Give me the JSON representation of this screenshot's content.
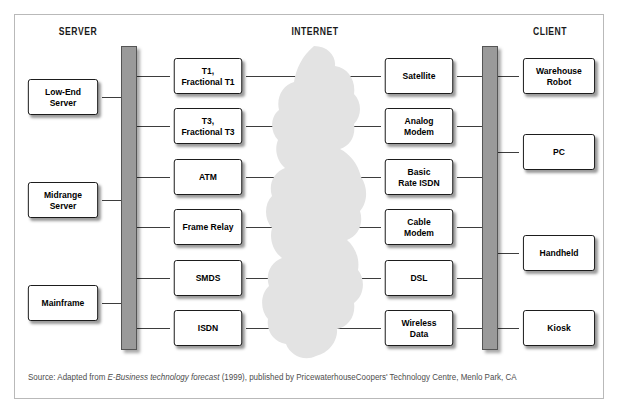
{
  "headers": {
    "server": "SERVER",
    "internet": "INTERNET",
    "client": "CLIENT"
  },
  "colors": {
    "bar_fill": "#9a9a9a",
    "bar_stroke": "#555555",
    "cloud_fill": "#e3e3e3",
    "box_fill": "#ffffff",
    "box_stroke": "#111111",
    "line": "#3d3d3d",
    "frame": "#b9b9b9",
    "caption_text": "#4d4d4d",
    "header_text": "#1a1a1a"
  },
  "columns": {
    "servers": [
      {
        "label": "Low-End\nServer",
        "top": 79
      },
      {
        "label": "Midrange\nServer",
        "top": 182
      },
      {
        "label": "Mainframe",
        "top": 285
      }
    ],
    "access": [
      {
        "label": "T1,\nFractional T1",
        "top": 58
      },
      {
        "label": "T3,\nFractional T3",
        "top": 108
      },
      {
        "label": "ATM",
        "top": 159
      },
      {
        "label": "Frame Relay",
        "top": 209
      },
      {
        "label": "SMDS",
        "top": 260
      },
      {
        "label": "ISDN",
        "top": 310
      }
    ],
    "carrier": [
      {
        "label": "Satellite",
        "top": 58
      },
      {
        "label": "Analog\nModem",
        "top": 108
      },
      {
        "label": "Basic\nRate ISDN",
        "top": 159
      },
      {
        "label": "Cable\nModem",
        "top": 209
      },
      {
        "label": "DSL",
        "top": 260
      },
      {
        "label": "Wireless\nData",
        "top": 310
      }
    ],
    "clients": [
      {
        "label": "Warehouse\nRobot",
        "top": 58
      },
      {
        "label": "PC",
        "top": 134
      },
      {
        "label": "Handheld",
        "top": 235
      },
      {
        "label": "Kiosk",
        "top": 310
      }
    ]
  },
  "caption": {
    "prefix": "Source: Adapted from ",
    "italic": "E-Business technology forecast",
    "suffix": " (1999), published by PricewaterhouseCoopers' Technology Centre, Menlo Park, CA"
  }
}
